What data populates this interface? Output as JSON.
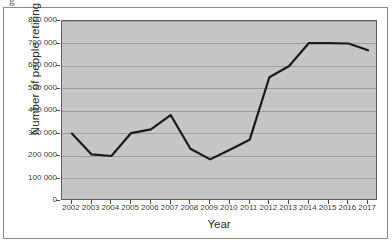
{
  "figure": {
    "scan_artifact_text": "g"
  },
  "chart_data": {
    "type": "line",
    "title": "",
    "xlabel": "Year",
    "ylabel": "Number of people retiring",
    "x": [
      2002,
      2003,
      2004,
      2005,
      2006,
      2007,
      2008,
      2009,
      2010,
      2011,
      2012,
      2013,
      2014,
      2015,
      2016,
      2017
    ],
    "categories": [
      "2002",
      "2003",
      "2004",
      "2005",
      "2006",
      "2007",
      "2008",
      "2009",
      "2010",
      "2011",
      "2012",
      "2013",
      "2014",
      "2015",
      "2016",
      "2017"
    ],
    "values": [
      300000,
      207000,
      200000,
      302000,
      318000,
      382000,
      232000,
      185000,
      228000,
      272000,
      550000,
      600000,
      702000,
      702000,
      700000,
      670000
    ],
    "ylim": [
      0,
      800000
    ],
    "ytick_values": [
      0,
      100000,
      200000,
      300000,
      400000,
      500000,
      600000,
      700000,
      800000
    ],
    "ytick_labels": [
      "0",
      "100 000",
      "200 000",
      "300 000",
      "400 000",
      "500 000",
      "600 000",
      "700 000",
      "800 000"
    ],
    "grid": true,
    "legend": "none",
    "series_color": "#1a1a1a",
    "plot_background": "#c6c6c6",
    "gridline_color": "#9d9d9d"
  }
}
